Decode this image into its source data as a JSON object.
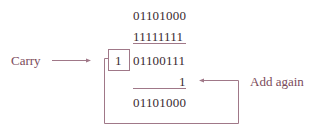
{
  "diagram": {
    "rows": [
      {
        "value": "01101000",
        "role": "operand-1"
      },
      {
        "value": "11111111",
        "role": "operand-2"
      },
      {
        "value": "01100111",
        "role": "partial-sum"
      },
      {
        "value": "1",
        "role": "end-around-carry"
      },
      {
        "value": "01101000",
        "role": "result"
      }
    ],
    "carry_bit": "1",
    "labels": {
      "carry": "Carry",
      "add_again": "Add again"
    },
    "colors": {
      "lines": "#a07888",
      "labels": "#7a4a5a",
      "numbers": "#3a2a30"
    }
  }
}
